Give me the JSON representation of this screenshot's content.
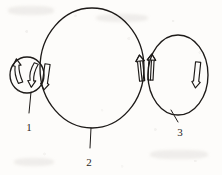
{
  "figure": {
    "kind": "line-drawing",
    "background_color": "#fdfcfa",
    "ink_color": "#1d1a18",
    "labels": [
      {
        "id": "label-1",
        "text": "1",
        "x": 29,
        "y": 131,
        "leader_from_x": 31,
        "leader_from_y": 92,
        "leader_to_x": 29,
        "leader_to_y": 113
      },
      {
        "id": "label-2",
        "text": "2",
        "x": 89,
        "y": 166,
        "leader_from_x": 91,
        "leader_from_y": 128,
        "leader_to_x": 90,
        "leader_to_y": 148
      },
      {
        "id": "label-3",
        "text": "3",
        "x": 180,
        "y": 136,
        "leader_from_x": 172,
        "leader_from_y": 111,
        "leader_to_x": 178,
        "leader_to_y": 122
      }
    ],
    "circles": [
      {
        "id": "circle-1",
        "label_ref": "1",
        "cx": 27,
        "cy": 75,
        "rx": 17,
        "ry": 18,
        "role": "small-left-chamber"
      },
      {
        "id": "circle-2",
        "label_ref": "2",
        "cx": 92,
        "cy": 68,
        "rx": 52,
        "ry": 60,
        "role": "large-center-chamber"
      },
      {
        "id": "circle-3",
        "label_ref": "3",
        "cx": 178,
        "cy": 75,
        "rx": 30,
        "ry": 40,
        "role": "medium-right-chamber"
      }
    ],
    "arrows": [
      {
        "id": "arrow-c1-left",
        "direction": "up",
        "curved": true,
        "x": 19,
        "y": 73,
        "height": 20,
        "width": 8,
        "rotation": -12
      },
      {
        "id": "arrow-c1-right",
        "direction": "down",
        "curved": true,
        "x": 34,
        "y": 73,
        "height": 20,
        "width": 8,
        "rotation": 14
      },
      {
        "id": "arrow-junction-left",
        "direction": "down",
        "curved": false,
        "x": 46,
        "y": 75,
        "height": 26,
        "width": 9,
        "rotation": 8
      },
      {
        "id": "arrow-junction-right-a",
        "direction": "up",
        "curved": false,
        "x": 141,
        "y": 69,
        "height": 24,
        "width": 9,
        "rotation": -6
      },
      {
        "id": "arrow-junction-right-b",
        "direction": "up",
        "curved": false,
        "x": 151,
        "y": 68,
        "height": 26,
        "width": 9,
        "rotation": 3
      },
      {
        "id": "arrow-c3-right",
        "direction": "down",
        "curved": false,
        "x": 197,
        "y": 73,
        "height": 24,
        "width": 9,
        "rotation": 6
      }
    ]
  }
}
